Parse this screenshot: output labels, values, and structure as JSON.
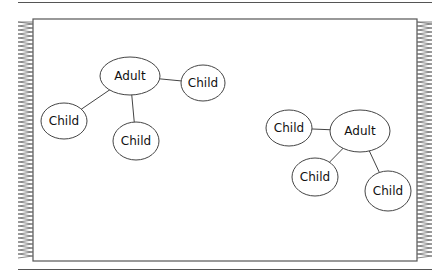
{
  "diagram": {
    "type": "family-cluster-diagram",
    "groups": [
      {
        "name": "group-left",
        "nodes": [
          {
            "id": "adult",
            "label": "Adult",
            "cx": 130,
            "cy": 76,
            "rx": 30,
            "ry": 19
          },
          {
            "id": "child1",
            "label": "Child",
            "cx": 203,
            "cy": 83,
            "rx": 22,
            "ry": 18
          },
          {
            "id": "child2",
            "label": "Child",
            "cx": 64,
            "cy": 121,
            "rx": 23,
            "ry": 18
          },
          {
            "id": "child3",
            "label": "Child",
            "cx": 136,
            "cy": 141,
            "rx": 23,
            "ry": 19
          }
        ],
        "edges": [
          [
            "adult",
            "child1"
          ],
          [
            "adult",
            "child2"
          ],
          [
            "adult",
            "child3"
          ]
        ]
      },
      {
        "name": "group-right",
        "nodes": [
          {
            "id": "adult",
            "label": "Adult",
            "cx": 360,
            "cy": 131,
            "rx": 30,
            "ry": 21
          },
          {
            "id": "child1",
            "label": "Child",
            "cx": 289,
            "cy": 128,
            "rx": 23,
            "ry": 18
          },
          {
            "id": "child2",
            "label": "Child",
            "cx": 315,
            "cy": 177,
            "rx": 23,
            "ry": 19
          },
          {
            "id": "child3",
            "label": "Child",
            "cx": 388,
            "cy": 191,
            "rx": 23,
            "ry": 20
          }
        ],
        "edges": [
          [
            "adult",
            "child1"
          ],
          [
            "adult",
            "child2"
          ],
          [
            "adult",
            "child3"
          ]
        ]
      }
    ],
    "colors": {
      "stroke": "#444444",
      "frame": "#555555",
      "background": "#ffffff"
    }
  }
}
